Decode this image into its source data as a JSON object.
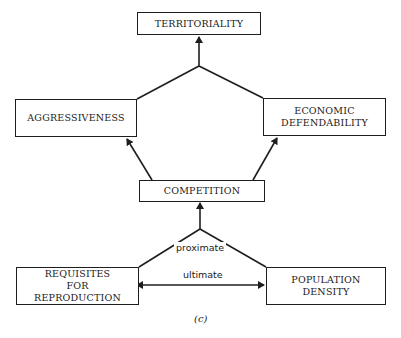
{
  "diagram": {
    "nodes": {
      "territoriality": "TERRITORIALITY",
      "aggressiveness": "AGGRESSIVENESS",
      "economic_defendability": "ECONOMIC DEFENDABILITY",
      "competition": "COMPETITION",
      "requisites_for_reproduction": "REQUISITES FOR REPRODUCTION",
      "population_density": "POPULATION DENSITY"
    },
    "edge_labels": {
      "proximate": "proximate",
      "ultimate": "ultimate"
    },
    "caption": "(c)",
    "colors": {
      "line": "#1e1e1e",
      "background": "#ffffff"
    }
  }
}
